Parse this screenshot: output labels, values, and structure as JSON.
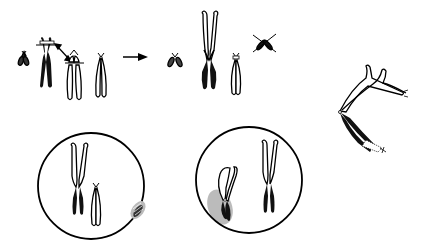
{
  "diagram": {
    "type": "chromosome-translocation-illustration",
    "background": "#ffffff",
    "ink_color": "#000000",
    "halo_color": "#999999",
    "panels": {
      "top_left": {
        "description": "small chromosome, black chromosome with break line, double-headed arrow, open chromosome with break line, open acrocentric chromosome"
      },
      "arrow": {
        "description": "right arrow indicating result"
      },
      "top_right": {
        "description": "small chromosome, large derivative chromosome (open top, black bottom), open acrocentric chromosome, crossed-out small fragment"
      },
      "far_right": {
        "description": "bent derivative chromosome with hatched end"
      },
      "bottom_left_cell": {
        "description": "nucleus with derivative chromosome, open chromosome, and halo fragment at periphery"
      },
      "bottom_right_cell": {
        "description": "nucleus with bent chromosome with halo at periphery and derivative chromosome"
      }
    },
    "text_labels": []
  }
}
